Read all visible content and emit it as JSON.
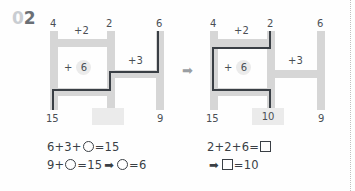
{
  "problem_number": {
    "zero": "0",
    "digit": "2"
  },
  "transition_arrow": "➡",
  "left_panel": {
    "top_numbers": [
      "4",
      "2",
      "6"
    ],
    "bottom_numbers": [
      "15",
      "",
      "9"
    ],
    "pipe_labels": {
      "top": "+2",
      "right": "+3",
      "inner_sign": "+",
      "inner_value": "6"
    },
    "answer_box_value": "",
    "equations": [
      {
        "parts": [
          "6+3+",
          "CIRCLE",
          "=15"
        ]
      },
      {
        "parts": [
          "9+",
          "CIRCLE",
          "=15",
          "ARROW",
          "CIRCLE",
          "=6"
        ]
      }
    ],
    "eq_line1_pre": "6+3+",
    "eq_line1_post": "=15",
    "eq_line2_pre": "9+",
    "eq_line2_mid": "=15",
    "eq_line2_post": "=6"
  },
  "right_panel": {
    "top_numbers": [
      "4",
      "2",
      "6"
    ],
    "bottom_numbers": [
      "15",
      "10",
      "9"
    ],
    "pipe_labels": {
      "top": "+2",
      "right": "+3",
      "inner_sign": "+",
      "inner_value": "6"
    },
    "answer_box_value": "10",
    "eq_line1_pre": "2+2+6=",
    "eq_line2_post": "=10"
  },
  "colors": {
    "pipe": "#d6d6d6",
    "route": "#3a3f45",
    "text": "#4a4f55",
    "highlight": "#ebebeb",
    "num_light": "#c9cdd2",
    "num_dark": "#6a6f75"
  }
}
